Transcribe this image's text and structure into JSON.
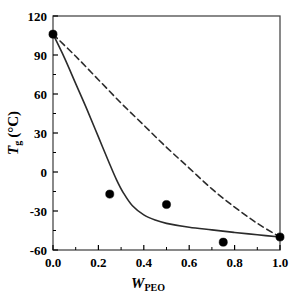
{
  "chart_data": {
    "type": "scatter",
    "title": "",
    "xlabel": "W_PEO",
    "xlabel_base": "W",
    "xlabel_sub": "PEO",
    "ylabel": "Tg (°C)",
    "ylabel_base": "T",
    "ylabel_sub": "g",
    "ylabel_unit": "(°C)",
    "xlim": [
      0.0,
      1.0
    ],
    "ylim": [
      -60,
      120
    ],
    "xticks": [
      0.0,
      0.2,
      0.4,
      0.6,
      0.8,
      1.0
    ],
    "xticklabels": [
      "0.0",
      "0.2",
      "0.4",
      "0.6",
      "0.8",
      "1.0"
    ],
    "yticks": [
      -60,
      -30,
      0,
      30,
      60,
      90,
      120
    ],
    "yticklabels": [
      "-60",
      "-30",
      "0",
      "30",
      "60",
      "90",
      "120"
    ],
    "xminorticks": [
      0.1,
      0.3,
      0.5,
      0.7,
      0.9
    ],
    "yminorticks": [
      -45,
      -15,
      15,
      45,
      75,
      105
    ],
    "grid": false,
    "legend": "none",
    "frame": true,
    "markers": {
      "name": "Measured glass transition temperature",
      "shape": "filled-circle",
      "color": "#000000",
      "size": 7,
      "x": [
        0.0,
        0.25,
        0.5,
        0.75,
        1.0
      ],
      "y": [
        106,
        -17,
        -25,
        -54,
        -50
      ]
    },
    "series": [
      {
        "name": "Gordon-Taylor fit",
        "style": "solid",
        "color": "#2b2b2b",
        "width": 1.6,
        "points": [
          [
            0.0,
            106.0
          ],
          [
            0.05,
            88.0
          ],
          [
            0.1,
            68.0
          ],
          [
            0.15,
            48.0
          ],
          [
            0.2,
            27.0
          ],
          [
            0.25,
            6.0
          ],
          [
            0.28,
            -6.0
          ],
          [
            0.31,
            -16.0
          ],
          [
            0.35,
            -26.0
          ],
          [
            0.4,
            -33.0
          ],
          [
            0.45,
            -37.0
          ],
          [
            0.5,
            -39.5
          ],
          [
            0.6,
            -42.5
          ],
          [
            0.7,
            -44.5
          ],
          [
            0.8,
            -46.5
          ],
          [
            0.9,
            -48.3
          ],
          [
            1.0,
            -50.0
          ]
        ]
      },
      {
        "name": "Fox equation prediction",
        "style": "dashed",
        "color": "#2b2b2b",
        "width": 1.6,
        "dasharray": "6,4",
        "points": [
          [
            0.0,
            106.0
          ],
          [
            0.1,
            89.0
          ],
          [
            0.2,
            71.0
          ],
          [
            0.3,
            53.0
          ],
          [
            0.4,
            36.0
          ],
          [
            0.5,
            19.0
          ],
          [
            0.6,
            3.0
          ],
          [
            0.7,
            -13.0
          ],
          [
            0.8,
            -27.0
          ],
          [
            0.9,
            -39.5
          ],
          [
            1.0,
            -50.0
          ]
        ]
      }
    ]
  },
  "axes_geometry": {
    "left": 53,
    "right": 280,
    "top": 16,
    "bottom": 250
  }
}
